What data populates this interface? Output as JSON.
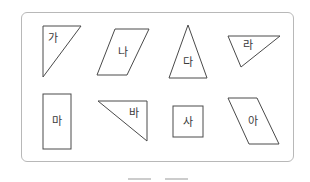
{
  "figure": {
    "border_color": "#b8b8b8",
    "stroke_color": "#4a4a4a",
    "shapes": [
      {
        "label": "가",
        "type": "right-triangle"
      },
      {
        "label": "나",
        "type": "parallelogram"
      },
      {
        "label": "다",
        "type": "isosceles-triangle"
      },
      {
        "label": "라",
        "type": "triangle"
      },
      {
        "label": "마",
        "type": "rectangle"
      },
      {
        "label": "바",
        "type": "right-triangle"
      },
      {
        "label": "사",
        "type": "square"
      },
      {
        "label": "아",
        "type": "parallelogram"
      }
    ]
  },
  "answer": {
    "blanks": [
      "",
      ""
    ]
  }
}
